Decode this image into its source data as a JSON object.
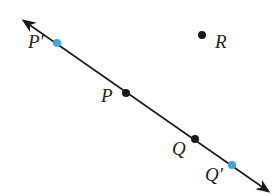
{
  "diagram": {
    "line": {
      "x1": 24,
      "y1": 21,
      "x2": 268,
      "y2": 191,
      "color": "#1a1a1a",
      "arrows": "both"
    },
    "points": [
      {
        "id": "P_prime",
        "label": "P′",
        "x": 57,
        "y": 43,
        "color": "#3aa6e0",
        "label_x": 28,
        "label_y": 42
      },
      {
        "id": "P",
        "label": "P",
        "x": 126,
        "y": 93,
        "color": "#1a1a1a",
        "label_x": 101,
        "label_y": 96
      },
      {
        "id": "Q",
        "label": "Q",
        "x": 195,
        "y": 139,
        "color": "#1a1a1a",
        "label_x": 172,
        "label_y": 149
      },
      {
        "id": "Q_prime",
        "label": "Q′",
        "x": 232,
        "y": 165,
        "color": "#3aa6e0",
        "label_x": 205,
        "label_y": 175
      },
      {
        "id": "R",
        "label": "R",
        "x": 202,
        "y": 35,
        "color": "#1a1a1a",
        "label_x": 215,
        "label_y": 42
      }
    ]
  }
}
